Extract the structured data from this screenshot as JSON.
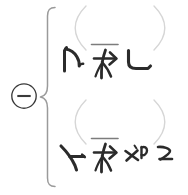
{
  "canvas": {
    "width": 188,
    "height": 195,
    "background": "#ffffff",
    "ink_color": "#2b2b2b",
    "bracket_color": "#9a9a9a",
    "paren_color": "#d6d6d6"
  },
  "operator": {
    "name": "circled-minus",
    "symbol": "⊖",
    "label": "circled minus",
    "color": "#3a3a3a"
  },
  "grouping": {
    "brace": {
      "name": "left-curly-brace",
      "symbol": "{",
      "label": "left curly brace",
      "color": "#9a9a9a"
    }
  },
  "rows": [
    {
      "id": "row-1",
      "label": "first handwritten expression row",
      "paren_open": "(",
      "paren_close": ")",
      "glyphs": [
        {
          "name": "stroke-glyph-hook-up",
          "label": "upward hook stroke",
          "type": "hook-up"
        },
        {
          "name": "stroke-glyph-barred-arrow",
          "label": "barred arrow stroke",
          "type": "barred-arrow"
        },
        {
          "name": "stroke-glyph-corner-l",
          "label": "corner L stroke",
          "type": "corner-l"
        }
      ]
    },
    {
      "id": "row-2",
      "label": "second handwritten expression row",
      "paren_open": "(",
      "paren_close": ")",
      "glyphs": [
        {
          "name": "stroke-glyph-y-mark",
          "label": "Y shaped stroke",
          "type": "y-mark"
        },
        {
          "name": "stroke-glyph-barred-arrow",
          "label": "barred arrow stroke",
          "type": "barred-arrow"
        },
        {
          "name": "stroke-glyph-scatter-marks",
          "label": "scattered small marks",
          "type": "scatter"
        }
      ]
    }
  ]
}
